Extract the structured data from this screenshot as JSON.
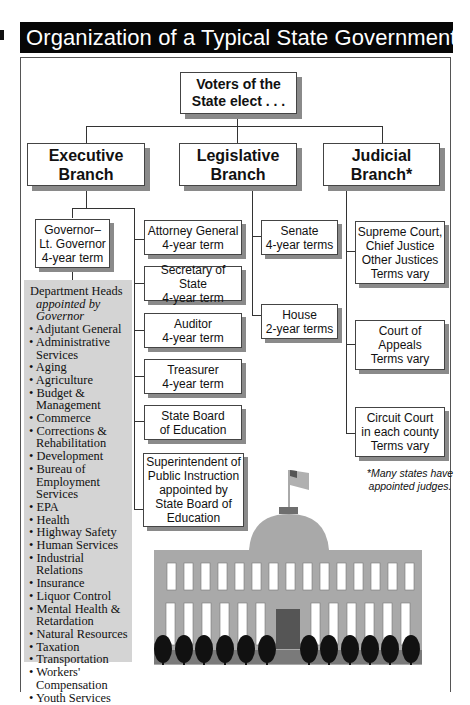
{
  "title": "Organization of a Typical State Government",
  "top": {
    "label_line1": "Voters of the",
    "label_line2": "State elect . . ."
  },
  "branches": [
    {
      "line1": "Executive",
      "line2": "Branch"
    },
    {
      "line1": "Legislative",
      "line2": "Branch"
    },
    {
      "line1": "Judicial",
      "line2": "Branch*"
    }
  ],
  "governor": {
    "line1": "Governor–",
    "line2": "Lt. Governor",
    "line3": "4-year term"
  },
  "executive_offices": [
    {
      "line1": "Attorney General",
      "line2": "4-year term"
    },
    {
      "line1": "Secretary of State",
      "line2": "4-year term"
    },
    {
      "line1": "Auditor",
      "line2": "4-year term"
    },
    {
      "line1": "Treasurer",
      "line2": "4-year term"
    },
    {
      "line1": "State Board",
      "line2": "of Education"
    },
    {
      "line1": "Superintendent of",
      "line2": "Public Instruction",
      "line3": "appointed by",
      "line4": "State Board of",
      "line5": "Education"
    }
  ],
  "department_heads": {
    "heading": "Department Heads",
    "subheading_line1": "appointed by",
    "subheading_line2": "Governor",
    "items": [
      "Adjutant General",
      "Administrative Services",
      "Aging",
      "Agriculture",
      "Budget & Management",
      "Commerce",
      "Corrections & Rehabilitation",
      "Development",
      "Bureau of Employment Services",
      "EPA",
      "Health",
      "Highway Safety",
      "Human Services",
      "Industrial Relations",
      "Insurance",
      "Liquor Control",
      "Mental Health & Retardation",
      "Natural Resources",
      "Taxation",
      "Transportation",
      "Workers' Compensation",
      "Youth Services"
    ]
  },
  "legislative": [
    {
      "line1": "Senate",
      "line2": "4-year terms"
    },
    {
      "line1": "House",
      "line2": "2-year terms"
    }
  ],
  "judicial": [
    {
      "line1": "Supreme Court,",
      "line2": "Chief Justice",
      "line3": "Other Justices",
      "line4": "Terms vary"
    },
    {
      "line1": "Court of",
      "line2": "Appeals",
      "line3": "Terms vary"
    },
    {
      "line1": "Circuit Court",
      "line2": "in each county",
      "line3": "Terms vary"
    }
  ],
  "footnote_line1": "*Many states have",
  "footnote_line2": "appointed judges.",
  "colors": {
    "title_bg": "#060606",
    "shadow": "#8a8a8a",
    "dept_bg": "#d4d4d4",
    "building": "#a9a9a9",
    "door": "#555555",
    "trees": "#111111"
  }
}
